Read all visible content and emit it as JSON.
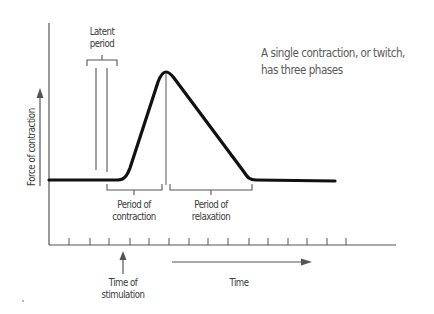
{
  "diagram": {
    "title": "A single contraction, or twitch, has three phases",
    "caption_lines": [
      "A single contraction, or twitch,",
      "has three phases"
    ],
    "y_axis_label": "Force of contraction",
    "x_axis_label": "Time",
    "annotations": {
      "latent_period": [
        "Latent",
        "period"
      ],
      "period_of_contraction": [
        "Period of",
        "contraction"
      ],
      "period_of_relaxation": [
        "Period of",
        "relaxation"
      ],
      "time_of_stimulation": [
        "Time of",
        "stimulation"
      ]
    },
    "phases": [
      "Latent period",
      "Period of contraction",
      "Period of relaxation"
    ],
    "tick_count": 15,
    "colors": {
      "curve": "#111111",
      "axis": "#555555",
      "text": "#3a3a3a",
      "caption": "#5a5a5a"
    }
  }
}
